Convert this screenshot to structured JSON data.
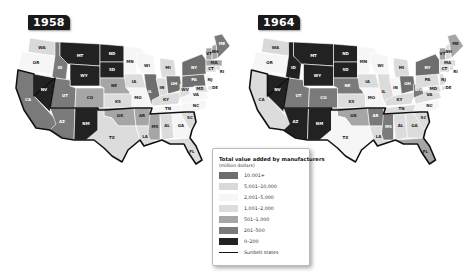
{
  "maps": [
    {
      "year": "1958",
      "states": {
        "WA": "c2",
        "OR": "c3",
        "CA": "c6",
        "NV": "c7",
        "ID": "c6",
        "MT": "c7",
        "WY": "c7",
        "UT": "c6",
        "AZ": "c6",
        "CO": "c5",
        "NM": "c7",
        "ND": "c7",
        "SD": "c7",
        "NE": "c5",
        "KS": "c4",
        "OK": "c5",
        "TX": "c4",
        "MN": "c3",
        "IA": "c4",
        "MO": "c3",
        "AR": "c5",
        "LA": "c4",
        "WI": "c3",
        "IL": "c1",
        "MI": "c4",
        "IN": "c4",
        "OH": "c1",
        "KY": "c4",
        "TN": "c3",
        "MS": "c5",
        "AL": "c4",
        "GA": "c3",
        "FL": "c4",
        "SC": "c4",
        "NC": "c3",
        "VA": "c3",
        "WV": "c4",
        "PA": "c1",
        "NY": "c1",
        "VT": "c5",
        "NH": "c5",
        "ME": "c6",
        "MA": "c5",
        "RI": "c4",
        "CT": "c4",
        "NJ": "c3",
        "DE": "c4",
        "MD": "c4"
      }
    },
    {
      "year": "1964",
      "states": {
        "WA": "c2",
        "OR": "c3",
        "CA": "c4",
        "NV": "c7",
        "ID": "c7",
        "MT": "c7",
        "WY": "c7",
        "UT": "c6",
        "AZ": "c7",
        "CO": "c6",
        "NM": "c7",
        "ND": "c7",
        "SD": "c7",
        "NE": "c6",
        "KS": "c4",
        "OK": "c5",
        "TX": "c3",
        "MN": "c3",
        "IA": "c4",
        "MO": "c3",
        "AR": "c6",
        "LA": "c4",
        "WI": "c3",
        "IL": "c4",
        "MI": "c4",
        "IN": "c3",
        "OH": "c1",
        "KY": "c4",
        "TN": "c4",
        "MS": "c6",
        "AL": "c4",
        "GA": "c4",
        "FL": "c5",
        "SC": "c4",
        "NC": "c3",
        "VA": "c4",
        "WV": "c6",
        "PA": "c4",
        "NY": "c1",
        "VT": "c5",
        "NH": "c4",
        "ME": "c5",
        "MA": "c4",
        "RI": "c4",
        "CT": "c4",
        "NJ": "c4",
        "DE": "c4",
        "MD": "c4"
      }
    }
  ],
  "legend": {
    "title": "Total value added by manufacturers",
    "subtitle": "(million dollars)",
    "items": [
      {
        "key": "c1",
        "label": "10,001+",
        "color": "#6e6e6e"
      },
      {
        "key": "c2",
        "label": "5,001–10,000",
        "color": "#d9d9d9"
      },
      {
        "key": "c3",
        "label": "2,001–5,000",
        "color": "#f6f6f6"
      },
      {
        "key": "c4",
        "label": "1,001–2,000",
        "color": "#dcdcdc"
      },
      {
        "key": "c5",
        "label": "501–1,000",
        "color": "#a6a6a6"
      },
      {
        "key": "c6",
        "label": "201–500",
        "color": "#7a7a7a"
      },
      {
        "key": "c7",
        "label": "0–200",
        "color": "#222222"
      }
    ],
    "sunbelt_label": "Sunbelt states"
  }
}
